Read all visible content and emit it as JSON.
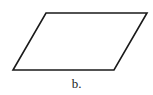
{
  "figure": {
    "shape": "parallelogram",
    "vertices": [
      [
        46,
        13
      ],
      [
        147,
        13
      ],
      [
        114,
        70
      ],
      [
        13,
        70
      ]
    ],
    "stroke_color": "#1a1a1a",
    "fill_color": "#ffffff",
    "caption": "b."
  }
}
